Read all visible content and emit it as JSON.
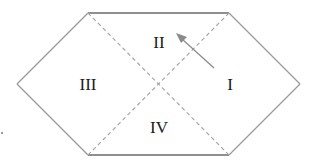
{
  "diagram": {
    "type": "penrose-carter-diagram",
    "regions": [
      {
        "id": "I",
        "label": "I",
        "x": 230,
        "y": 84
      },
      {
        "id": "II",
        "label": "II",
        "x": 159,
        "y": 42
      },
      {
        "id": "III",
        "label": "III",
        "x": 88,
        "y": 84
      },
      {
        "id": "IV",
        "label": "IV",
        "x": 159,
        "y": 127
      }
    ],
    "arrow": {
      "from": [
        214,
        68
      ],
      "to": [
        178,
        35
      ],
      "description": "arrow from region I pointing into region II"
    },
    "colors": {
      "edge": "#9a9a9a",
      "dashed": "#a8a8a8",
      "text": "#1a1a1a"
    }
  }
}
